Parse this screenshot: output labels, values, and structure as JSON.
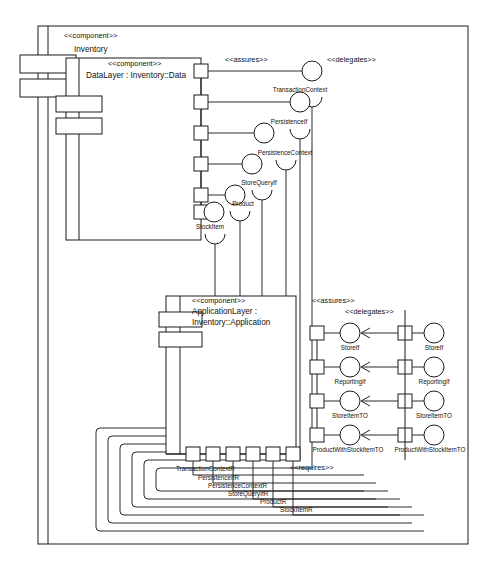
{
  "diagram": {
    "kind": "uml-component-diagram",
    "background": "#ffffff",
    "line_color": "#1a1a1a"
  },
  "outer_component": {
    "stereotype": "<<component>>",
    "name": "Inventory"
  },
  "data_layer": {
    "stereotype": "<<component>>",
    "name": "DataLayer : Inventory::Data"
  },
  "application_layer": {
    "stereotype": "<<component>>",
    "name_line1": "ApplicationLayer :",
    "name_line2": "Inventory::Application"
  },
  "stereotypes": {
    "assures_top": "<<assures>>",
    "delegates_top": "<<delegates>>",
    "assures_mid": "<<assures>>",
    "delegates_mid": "<<delegates>>",
    "requires": "<<requires>>"
  },
  "data_layer_interfaces": [
    {
      "label": "TransactionContext"
    },
    {
      "label": "PersistenceIf"
    },
    {
      "label": "PersistenceContext"
    },
    {
      "label": "StoreQueryIf"
    },
    {
      "label": "Product"
    },
    {
      "label": "StockItem"
    }
  ],
  "application_provided_interfaces": [
    {
      "label": "StoreIf"
    },
    {
      "label": "ReportingIf"
    },
    {
      "label": "StoreItemTO"
    },
    {
      "label": "ProductWithStockItemTO"
    }
  ],
  "inventory_provided_interfaces": [
    {
      "label": "StoreIf"
    },
    {
      "label": "ReportingIf"
    },
    {
      "label": "StoreItemTO"
    },
    {
      "label": "ProductWithStockItemTO"
    }
  ],
  "application_required_ports": [
    {
      "label": "TransactionContextR"
    },
    {
      "label": "PersistenceIfR"
    },
    {
      "label": "PersistenceContextR"
    },
    {
      "label": "StoreQueryIfR"
    },
    {
      "label": "ProductR"
    },
    {
      "label": "StockItemR"
    }
  ]
}
